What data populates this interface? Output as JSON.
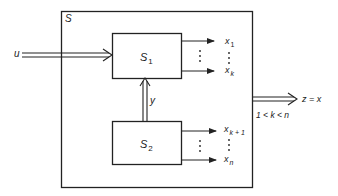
{
  "diagram": {
    "outer_system": {
      "label": "S"
    },
    "subsystem_1": {
      "label": "S",
      "subscript": "1"
    },
    "subsystem_2": {
      "label": "S",
      "subscript": "2"
    },
    "input": {
      "label": "u"
    },
    "coupling": {
      "label": "y"
    },
    "outputs_s1": {
      "first": "x",
      "first_sub": "1",
      "last": "x",
      "last_sub": "k"
    },
    "outputs_s2": {
      "first": "x",
      "first_sub": "k + 1",
      "last": "x",
      "last_sub": "n"
    },
    "system_output": {
      "label": "z = x",
      "condition": "1 < k < n"
    }
  },
  "colors": {
    "stroke": "#222222",
    "background": "#ffffff"
  }
}
